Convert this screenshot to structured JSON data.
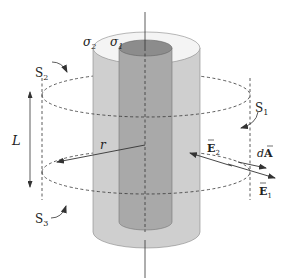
{
  "figure": {
    "colors": {
      "background": "#ffffff",
      "outer_shell": "#cfcfcf",
      "outer_shell_top": "#f4f4f4",
      "inner_cylinder": "#a9a9a9",
      "inner_cylinder_top": "#8c8c8c",
      "lines": "#333333"
    },
    "labels": {
      "sigma2": "σ",
      "sigma2_sub": "2",
      "sigma1": "σ",
      "sigma1_sub": "1",
      "S2": "S",
      "S2_sub": "2",
      "S1": "S",
      "S1_sub": "1",
      "S3": "S",
      "S3_sub": "3",
      "L": "L",
      "r": "r",
      "E2": "E",
      "E2_sub": "2",
      "E1": "E",
      "E1_sub": "1",
      "dA_d": "d",
      "dA_A": "A"
    },
    "surfaces": [
      "S1 (curved side)",
      "S2 (top cap)",
      "S3 (bottom cap)"
    ],
    "charges": [
      "σ1 (inner cylinder)",
      "σ2 (outer shell)"
    ]
  }
}
